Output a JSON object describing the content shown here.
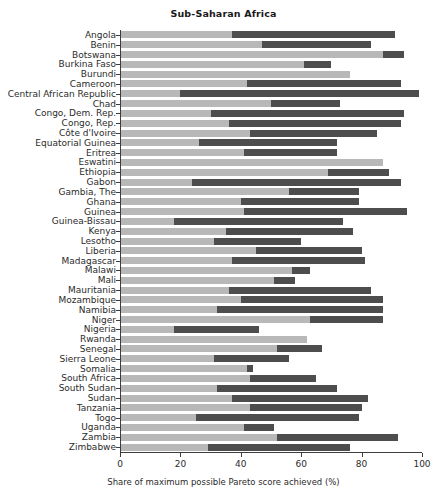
{
  "chart_data": {
    "type": "bar",
    "orientation": "horizontal",
    "stacked": true,
    "title": "Sub-Saharan Africa",
    "xlabel": "Share of maximum possible Pareto score achieved (%)",
    "ylabel": "",
    "xlim": [
      0,
      100
    ],
    "xticks": [
      0,
      20,
      40,
      60,
      80,
      100
    ],
    "xticklabels": [
      "0",
      "20",
      "40",
      "60",
      "80",
      "100"
    ],
    "grid": false,
    "legend": "none",
    "colors": {
      "segment_light": "#b8b8b8",
      "segment_dark": "#4d4d4d",
      "axis": "#3d3d3d",
      "text": "#2b2b2b"
    },
    "categories": [
      "Angola",
      "Benin",
      "Botswana",
      "Burkina Faso",
      "Burundi",
      "Cameroon",
      "Central African Republic",
      "Chad",
      "Congo, Dem. Rep.",
      "Congo, Rep.",
      "Côte d'Ivoire",
      "Equatorial Guinea",
      "Eritrea",
      "Eswatini",
      "Ethiopia",
      "Gabon",
      "Gambia, The",
      "Ghana",
      "Guinea",
      "Guinea-Bissau",
      "Kenya",
      "Lesotho",
      "Liberia",
      "Madagascar",
      "Malawi",
      "Mali",
      "Mauritania",
      "Mozambique",
      "Namibia",
      "Niger",
      "Nigeria",
      "Rwanda",
      "Senegal",
      "Sierra Leone",
      "Somalia",
      "South Africa",
      "South Sudan",
      "Sudan",
      "Tanzania",
      "Togo",
      "Uganda",
      "Zambia",
      "Zimbabwe"
    ],
    "series": [
      {
        "name": "light-segment",
        "values": [
          37,
          47,
          87,
          61,
          76,
          42,
          20,
          50,
          30,
          36,
          43,
          26,
          41,
          87,
          69,
          24,
          56,
          40,
          41,
          18,
          35,
          31,
          45,
          37,
          57,
          51,
          36,
          40,
          32,
          63,
          18,
          62,
          52,
          31,
          42,
          43,
          32,
          37,
          43,
          25,
          41,
          52,
          29
        ]
      },
      {
        "name": "dark-segment",
        "values": [
          54,
          36,
          7,
          9,
          0,
          51,
          79,
          23,
          64,
          57,
          42,
          46,
          31,
          0,
          20,
          69,
          23,
          39,
          54,
          56,
          42,
          29,
          35,
          44,
          6,
          7,
          47,
          47,
          55,
          24,
          28,
          0,
          15,
          25,
          2,
          22,
          40,
          45,
          37,
          54,
          10,
          40,
          47
        ]
      }
    ]
  }
}
